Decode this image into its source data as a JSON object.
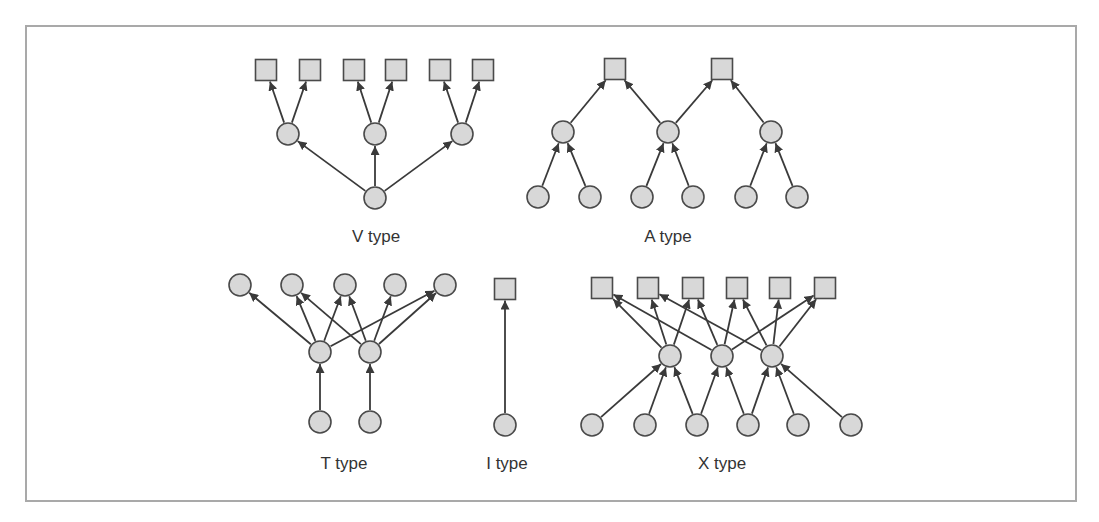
{
  "diagram": {
    "title": "",
    "colors": {
      "node_fill": "#d8d8d8",
      "node_stroke": "#4a4a4a",
      "edge": "#3a3a3a",
      "frame": "#a9a9a9",
      "label": "#333333"
    },
    "groups": [
      {
        "id": "v",
        "label": "V type",
        "label_pos": [
          376,
          242
        ],
        "nodes": [
          {
            "id": "v_s1",
            "shape": "square",
            "x": 266,
            "y": 70
          },
          {
            "id": "v_s2",
            "shape": "square",
            "x": 310,
            "y": 70
          },
          {
            "id": "v_s3",
            "shape": "square",
            "x": 354,
            "y": 70
          },
          {
            "id": "v_s4",
            "shape": "square",
            "x": 396,
            "y": 70
          },
          {
            "id": "v_s5",
            "shape": "square",
            "x": 440,
            "y": 70
          },
          {
            "id": "v_s6",
            "shape": "square",
            "x": 483,
            "y": 70
          },
          {
            "id": "v_m1",
            "shape": "circle",
            "x": 288,
            "y": 134
          },
          {
            "id": "v_m2",
            "shape": "circle",
            "x": 375,
            "y": 134
          },
          {
            "id": "v_m3",
            "shape": "circle",
            "x": 462,
            "y": 134
          },
          {
            "id": "v_b1",
            "shape": "circle",
            "x": 375,
            "y": 198
          }
        ],
        "edges": [
          [
            "v_b1",
            "v_m1"
          ],
          [
            "v_b1",
            "v_m2"
          ],
          [
            "v_b1",
            "v_m3"
          ],
          [
            "v_m1",
            "v_s1"
          ],
          [
            "v_m1",
            "v_s2"
          ],
          [
            "v_m2",
            "v_s3"
          ],
          [
            "v_m2",
            "v_s4"
          ],
          [
            "v_m3",
            "v_s5"
          ],
          [
            "v_m3",
            "v_s6"
          ]
        ]
      },
      {
        "id": "a",
        "label": "A type",
        "label_pos": [
          668,
          242
        ],
        "nodes": [
          {
            "id": "a_s1",
            "shape": "square",
            "x": 615,
            "y": 69
          },
          {
            "id": "a_s2",
            "shape": "square",
            "x": 722,
            "y": 69
          },
          {
            "id": "a_m1",
            "shape": "circle",
            "x": 563,
            "y": 132
          },
          {
            "id": "a_m2",
            "shape": "circle",
            "x": 668,
            "y": 132
          },
          {
            "id": "a_m3",
            "shape": "circle",
            "x": 771,
            "y": 132
          },
          {
            "id": "a_b1",
            "shape": "circle",
            "x": 538,
            "y": 197
          },
          {
            "id": "a_b2",
            "shape": "circle",
            "x": 590,
            "y": 197
          },
          {
            "id": "a_b3",
            "shape": "circle",
            "x": 642,
            "y": 197
          },
          {
            "id": "a_b4",
            "shape": "circle",
            "x": 693,
            "y": 197
          },
          {
            "id": "a_b5",
            "shape": "circle",
            "x": 746,
            "y": 197
          },
          {
            "id": "a_b6",
            "shape": "circle",
            "x": 797,
            "y": 197
          }
        ],
        "edges": [
          [
            "a_b1",
            "a_m1"
          ],
          [
            "a_b2",
            "a_m1"
          ],
          [
            "a_b3",
            "a_m2"
          ],
          [
            "a_b4",
            "a_m2"
          ],
          [
            "a_b5",
            "a_m3"
          ],
          [
            "a_b6",
            "a_m3"
          ],
          [
            "a_m1",
            "a_s1"
          ],
          [
            "a_m2",
            "a_s1"
          ],
          [
            "a_m2",
            "a_s2"
          ],
          [
            "a_m3",
            "a_s2"
          ]
        ]
      },
      {
        "id": "t",
        "label": "T type",
        "label_pos": [
          344,
          469
        ],
        "nodes": [
          {
            "id": "t_t1",
            "shape": "circle",
            "x": 240,
            "y": 285
          },
          {
            "id": "t_t2",
            "shape": "circle",
            "x": 292,
            "y": 285
          },
          {
            "id": "t_t3",
            "shape": "circle",
            "x": 345,
            "y": 285
          },
          {
            "id": "t_t4",
            "shape": "circle",
            "x": 395,
            "y": 285
          },
          {
            "id": "t_t5",
            "shape": "circle",
            "x": 445,
            "y": 285
          },
          {
            "id": "t_m1",
            "shape": "circle",
            "x": 320,
            "y": 352
          },
          {
            "id": "t_m2",
            "shape": "circle",
            "x": 370,
            "y": 352
          },
          {
            "id": "t_b1",
            "shape": "circle",
            "x": 320,
            "y": 422
          },
          {
            "id": "t_b2",
            "shape": "circle",
            "x": 370,
            "y": 422
          }
        ],
        "edges": [
          [
            "t_b1",
            "t_m1"
          ],
          [
            "t_b2",
            "t_m2"
          ],
          [
            "t_m1",
            "t_t1"
          ],
          [
            "t_m1",
            "t_t2"
          ],
          [
            "t_m1",
            "t_t3"
          ],
          [
            "t_m1",
            "t_t5"
          ],
          [
            "t_m2",
            "t_t2"
          ],
          [
            "t_m2",
            "t_t3"
          ],
          [
            "t_m2",
            "t_t4"
          ],
          [
            "t_m2",
            "t_t5"
          ]
        ]
      },
      {
        "id": "i",
        "label": "I type",
        "label_pos": [
          507,
          469
        ],
        "nodes": [
          {
            "id": "i_s1",
            "shape": "square",
            "x": 505,
            "y": 289
          },
          {
            "id": "i_b1",
            "shape": "circle",
            "x": 505,
            "y": 425
          }
        ],
        "edges": [
          [
            "i_b1",
            "i_s1"
          ]
        ]
      },
      {
        "id": "x",
        "label": "X type",
        "label_pos": [
          722,
          469
        ],
        "nodes": [
          {
            "id": "x_s1",
            "shape": "square",
            "x": 602,
            "y": 288
          },
          {
            "id": "x_s2",
            "shape": "square",
            "x": 648,
            "y": 288
          },
          {
            "id": "x_s3",
            "shape": "square",
            "x": 693,
            "y": 288
          },
          {
            "id": "x_s4",
            "shape": "square",
            "x": 737,
            "y": 288
          },
          {
            "id": "x_s5",
            "shape": "square",
            "x": 780,
            "y": 288
          },
          {
            "id": "x_s6",
            "shape": "square",
            "x": 825,
            "y": 288
          },
          {
            "id": "x_m1",
            "shape": "circle",
            "x": 670,
            "y": 356
          },
          {
            "id": "x_m2",
            "shape": "circle",
            "x": 722,
            "y": 356
          },
          {
            "id": "x_m3",
            "shape": "circle",
            "x": 772,
            "y": 356
          },
          {
            "id": "x_b1",
            "shape": "circle",
            "x": 592,
            "y": 425
          },
          {
            "id": "x_b2",
            "shape": "circle",
            "x": 645,
            "y": 425
          },
          {
            "id": "x_b3",
            "shape": "circle",
            "x": 697,
            "y": 425
          },
          {
            "id": "x_b4",
            "shape": "circle",
            "x": 748,
            "y": 425
          },
          {
            "id": "x_b5",
            "shape": "circle",
            "x": 798,
            "y": 425
          },
          {
            "id": "x_b6",
            "shape": "circle",
            "x": 851,
            "y": 425
          }
        ],
        "edges": [
          [
            "x_b1",
            "x_m1"
          ],
          [
            "x_b2",
            "x_m1"
          ],
          [
            "x_b3",
            "x_m1"
          ],
          [
            "x_b3",
            "x_m2"
          ],
          [
            "x_b4",
            "x_m2"
          ],
          [
            "x_b4",
            "x_m3"
          ],
          [
            "x_b5",
            "x_m3"
          ],
          [
            "x_b6",
            "x_m3"
          ],
          [
            "x_m1",
            "x_s1"
          ],
          [
            "x_m1",
            "x_s2"
          ],
          [
            "x_m1",
            "x_s3"
          ],
          [
            "x_m2",
            "x_s1"
          ],
          [
            "x_m2",
            "x_s3"
          ],
          [
            "x_m2",
            "x_s4"
          ],
          [
            "x_m2",
            "x_s6"
          ],
          [
            "x_m3",
            "x_s2"
          ],
          [
            "x_m3",
            "x_s4"
          ],
          [
            "x_m3",
            "x_s5"
          ],
          [
            "x_m3",
            "x_s6"
          ]
        ]
      }
    ]
  }
}
